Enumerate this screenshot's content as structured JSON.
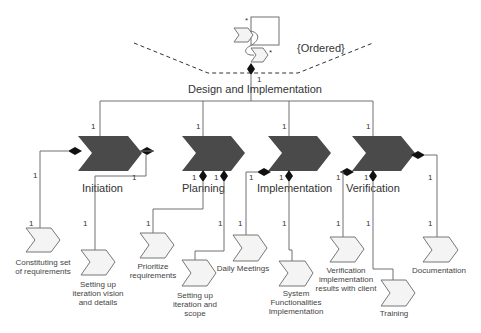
{
  "diagram": {
    "root": {
      "label": "Design and Implementation",
      "constraint": "{Ordered}",
      "multiplicity": "1",
      "icon_multiplicity_top": "*",
      "icon_multiplicity_bottom": "*"
    },
    "phases": [
      {
        "name": "Initiation",
        "multiplicity": "1",
        "tasks": [
          {
            "label_lines": [
              "Constituting set",
              "of requirements"
            ],
            "multiplicity": "1"
          },
          {
            "label_lines": [
              "Setting up",
              "iteration vision",
              "and details"
            ],
            "multiplicity": "1"
          }
        ]
      },
      {
        "name": "Planning",
        "multiplicity": "1",
        "tasks": [
          {
            "label_lines": [
              "Prioritize",
              "requirements"
            ],
            "multiplicity": "1"
          },
          {
            "label_lines": [
              "Setting up",
              "iteration and",
              "scope"
            ],
            "multiplicity": "1"
          }
        ]
      },
      {
        "name": "Implementation",
        "multiplicity": "1",
        "tasks": [
          {
            "label_lines": [
              "Daily Meetings"
            ],
            "multiplicity": "1"
          },
          {
            "label_lines": [
              "System",
              "Functionalities",
              "Implementation"
            ],
            "multiplicity": "1"
          }
        ]
      },
      {
        "name": "Verification",
        "multiplicity": "1",
        "tasks": [
          {
            "label_lines": [
              "Verification",
              "implementation",
              "results with client"
            ],
            "multiplicity": "1"
          },
          {
            "label_lines": [
              "Training"
            ],
            "multiplicity": "1"
          },
          {
            "label_lines": [
              "Documentation"
            ],
            "multiplicity": "1"
          }
        ]
      }
    ]
  }
}
